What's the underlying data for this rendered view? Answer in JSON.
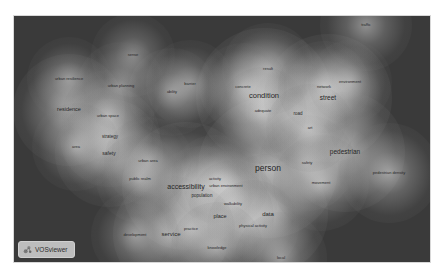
{
  "app": {
    "name": "VOSviewer",
    "view": "density visualization"
  },
  "colors": {
    "background": "#3a3a3a",
    "density_peak": "#f2f2f2",
    "label": "#262626"
  },
  "canvas": {
    "x": 14,
    "y": 16,
    "width": 416,
    "height": 246
  },
  "terms": [
    {
      "label": "person",
      "x": 254,
      "y": 152,
      "size": 8.5,
      "density": 1.0
    },
    {
      "label": "condition",
      "x": 250,
      "y": 80,
      "size": 7.5,
      "density": 0.95
    },
    {
      "label": "accessibility",
      "x": 172,
      "y": 170,
      "size": 7,
      "density": 0.85
    },
    {
      "label": "street",
      "x": 314,
      "y": 82,
      "size": 6.5,
      "density": 0.85
    },
    {
      "label": "pedestrian",
      "x": 331,
      "y": 136,
      "size": 6.5,
      "density": 0.75
    },
    {
      "label": "service",
      "x": 157,
      "y": 218,
      "size": 6,
      "density": 0.7
    },
    {
      "label": "data",
      "x": 254,
      "y": 198,
      "size": 6,
      "density": 0.75
    },
    {
      "label": "place",
      "x": 206,
      "y": 201,
      "size": 5.5,
      "density": 0.6
    },
    {
      "label": "residence",
      "x": 55,
      "y": 94,
      "size": 5.5,
      "density": 0.65
    },
    {
      "label": "safety",
      "x": 95,
      "y": 137,
      "size": 5,
      "density": 0.6
    },
    {
      "label": "strategy",
      "x": 96,
      "y": 121,
      "size": 4.5,
      "density": 0.5
    },
    {
      "label": "population",
      "x": 188,
      "y": 180,
      "size": 4.5,
      "density": 0.5
    },
    {
      "label": "road",
      "x": 284,
      "y": 98,
      "size": 4.5,
      "density": 0.5
    },
    {
      "label": "safety",
      "x": 293,
      "y": 147,
      "size": 4,
      "density": 0.45
    },
    {
      "label": "movement",
      "x": 307,
      "y": 167,
      "size": 4,
      "density": 0.45
    },
    {
      "label": "pedestrian density",
      "x": 375,
      "y": 157,
      "size": 4,
      "density": 0.5
    },
    {
      "label": "traffic",
      "x": 352,
      "y": 9,
      "size": 4,
      "density": 0.4
    },
    {
      "label": "result",
      "x": 254,
      "y": 53,
      "size": 4,
      "density": 0.4
    },
    {
      "label": "concrete",
      "x": 229,
      "y": 71,
      "size": 4,
      "density": 0.35
    },
    {
      "label": "adequate",
      "x": 249,
      "y": 95,
      "size": 4,
      "density": 0.35
    },
    {
      "label": "network",
      "x": 310,
      "y": 71,
      "size": 4,
      "density": 0.4
    },
    {
      "label": "environment",
      "x": 336,
      "y": 66,
      "size": 4,
      "density": 0.3
    },
    {
      "label": "art",
      "x": 296,
      "y": 112,
      "size": 4,
      "density": 0.35
    },
    {
      "label": "barrier",
      "x": 176,
      "y": 68,
      "size": 4,
      "density": 0.35
    },
    {
      "label": "ability",
      "x": 158,
      "y": 76,
      "size": 4,
      "density": 0.35
    },
    {
      "label": "sense",
      "x": 119,
      "y": 39,
      "size": 4,
      "density": 0.3
    },
    {
      "label": "urban planning",
      "x": 107,
      "y": 70,
      "size": 4,
      "density": 0.35
    },
    {
      "label": "urban resilience",
      "x": 55,
      "y": 63,
      "size": 4,
      "density": 0.3
    },
    {
      "label": "urban space",
      "x": 94,
      "y": 100,
      "size": 4,
      "density": 0.4
    },
    {
      "label": "area",
      "x": 62,
      "y": 131,
      "size": 4,
      "density": 0.35
    },
    {
      "label": "urban area",
      "x": 134,
      "y": 145,
      "size": 4,
      "density": 0.35
    },
    {
      "label": "public realm",
      "x": 126,
      "y": 163,
      "size": 4,
      "density": 0.35
    },
    {
      "label": "activity",
      "x": 201,
      "y": 163,
      "size": 4,
      "density": 0.35
    },
    {
      "label": "urban environment",
      "x": 212,
      "y": 170,
      "size": 4,
      "density": 0.3
    },
    {
      "label": "walkability",
      "x": 219,
      "y": 188,
      "size": 4,
      "density": 0.35
    },
    {
      "label": "physical activity",
      "x": 239,
      "y": 210,
      "size": 4,
      "density": 0.4
    },
    {
      "label": "practice",
      "x": 177,
      "y": 213,
      "size": 4,
      "density": 0.35
    },
    {
      "label": "knowledge",
      "x": 203,
      "y": 232,
      "size": 4,
      "density": 0.4
    },
    {
      "label": "development",
      "x": 121,
      "y": 219,
      "size": 4,
      "density": 0.35
    },
    {
      "label": "local",
      "x": 267,
      "y": 242,
      "size": 4,
      "density": 0.4
    }
  ],
  "logo": {
    "label": "VOSviewer",
    "icon": "vosviewer-logo-icon"
  }
}
